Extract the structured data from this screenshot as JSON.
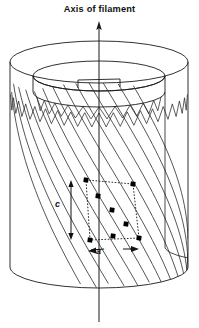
{
  "figure": {
    "title": "Axis of filament",
    "kind": "cellulose-microfibril-cylinder-diagram",
    "background_color": "#ffffff",
    "line_color": "#1a1a1a",
    "dot_color": "#000000",
    "canvas": {
      "width": 199,
      "height": 328
    }
  },
  "axis": {
    "label": "Axis of filament",
    "arrow_head_y": 22,
    "line_x": 99,
    "line_top_y": 22,
    "line_bottom_y": 322
  },
  "cylinder": {
    "center_x": 99,
    "outer_rx": 89,
    "outer_ry": 21,
    "top_cy": 62,
    "bottom_cy": 267,
    "inner_rx": 66,
    "inner_ry": 15,
    "inner_top_cy": 76,
    "wall_left_x": 10,
    "wall_right_x": 188,
    "teeth_count": 18
  },
  "lattice": {
    "helix_family_a_count": 13,
    "helix_family_b_count": 13,
    "description": "two crossing families of helical chains"
  },
  "unit_cell": {
    "label_c": "c",
    "label_a": "a",
    "corners": [
      {
        "x": 86,
        "y": 180
      },
      {
        "x": 133,
        "y": 184
      },
      {
        "x": 139,
        "y": 238
      },
      {
        "x": 90,
        "y": 240
      }
    ],
    "lattice_points": [
      {
        "x": 86,
        "y": 180
      },
      {
        "x": 133,
        "y": 184
      },
      {
        "x": 139,
        "y": 238
      },
      {
        "x": 90,
        "y": 240
      },
      {
        "x": 112,
        "y": 210
      },
      {
        "x": 98,
        "y": 196
      },
      {
        "x": 126,
        "y": 224
      },
      {
        "x": 113,
        "y": 236
      }
    ],
    "c_arrow": {
      "x": 71,
      "y_top": 180,
      "y_bottom": 240
    },
    "a_arrow": {
      "y": 250,
      "x_left": 88,
      "x_right": 139
    }
  }
}
